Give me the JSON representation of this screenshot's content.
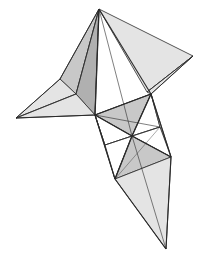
{
  "figure": {
    "colors": {
      "stroke": "#2a2a2a",
      "light": "#e4e4e4",
      "mid": "#c8c8c8",
      "dark": "#b0b0b0",
      "white": "#ffffff"
    },
    "vertices": {
      "apex": [
        99,
        9
      ],
      "right_tip": [
        193,
        56
      ],
      "left_tip": [
        16,
        118
      ],
      "left_fold": [
        60,
        79
      ],
      "left_inner": [
        76,
        94
      ],
      "left_junction": [
        95,
        115
      ],
      "right_junction": [
        151,
        94
      ],
      "right_inner": [
        147,
        92
      ],
      "center": [
        132,
        136
      ],
      "mid_left": [
        105,
        145
      ],
      "mid_right": [
        160,
        127
      ],
      "lower_right": [
        171,
        157
      ],
      "lower_left": [
        115,
        179
      ],
      "bottom_tip": [
        166,
        249
      ]
    }
  }
}
